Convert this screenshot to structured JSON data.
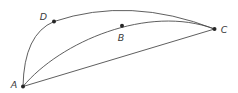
{
  "figure": {
    "width": 238,
    "height": 93,
    "background_color": "#ffffff",
    "line_color": "#4d4d4d",
    "line_width": 0.9,
    "dot_color": "#262626",
    "dot_radius": 2,
    "label_color": "#3a3a3a",
    "points": [
      {
        "id": "A",
        "label": "A",
        "x": 23,
        "y": 86.5,
        "label_x": 14,
        "label_y": 88
      },
      {
        "id": "D",
        "label": "D",
        "x": 54,
        "y": 21.5,
        "label_x": 43.5,
        "label_y": 20
      },
      {
        "id": "B",
        "label": "B",
        "x": 122,
        "y": 25.7,
        "label_x": 121,
        "label_y": 41
      },
      {
        "id": "C",
        "label": "C",
        "x": 214.5,
        "y": 29,
        "label_x": 224,
        "label_y": 33
      }
    ],
    "edges": [
      {
        "id": "arc-A-D-C",
        "from": "A",
        "via": "D",
        "to": "C",
        "path": "M 23 86.5 Q 24 34 54 21.5 Q 130 -4 214.5 29"
      },
      {
        "id": "arc-A-B-C",
        "from": "A",
        "via": "B",
        "to": "C",
        "path": "M 23 86.5 C 60 42 148 4 214.5 29"
      },
      {
        "id": "segment-A-C",
        "from": "A",
        "to": "C",
        "path": "M 23 86.5 L 214.5 29"
      }
    ]
  }
}
